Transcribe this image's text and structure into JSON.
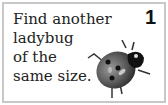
{
  "card": {
    "lines": [
      "Find another",
      "ladybug",
      "of the",
      "same size."
    ],
    "number": "1",
    "image": "ladybug-icon",
    "border_color": "#c8c8c8"
  }
}
